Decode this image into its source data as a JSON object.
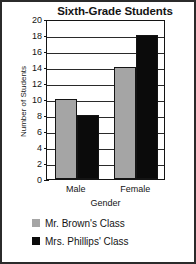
{
  "chart_data": {
    "type": "bar",
    "title": "Sixth-Grade Students",
    "xlabel": "Gender",
    "ylabel": "Number of Students",
    "categories": [
      "Male",
      "Female"
    ],
    "series": [
      {
        "name": "Mr. Brown's Class",
        "color": "#a5a5a5",
        "values": [
          10,
          14
        ]
      },
      {
        "name": "Mrs. Phillips' Class",
        "color": "#0b0b0b",
        "values": [
          8,
          18
        ]
      }
    ],
    "ylim": [
      0,
      20
    ],
    "ytick_step": 2,
    "yticks": [
      20,
      18,
      16,
      14,
      12,
      10,
      8,
      6,
      4,
      2,
      0
    ],
    "grid": true,
    "grid_axis": "y",
    "legend_position": "bottom"
  },
  "legend": {
    "items": [
      {
        "label": "Mr. Brown's Class",
        "swatch": "gray"
      },
      {
        "label": "Mrs. Phillips' Class",
        "swatch": "black"
      }
    ]
  }
}
